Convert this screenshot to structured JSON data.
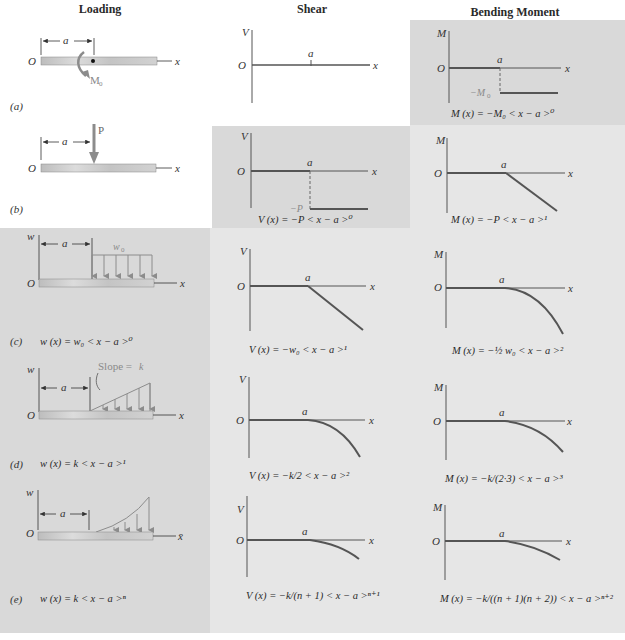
{
  "headers": {
    "loading": "Loading",
    "shear": "Shear",
    "moment": "Bending Moment"
  },
  "colors": {
    "panel_dark": "#d9d9d9",
    "panel_light": "#e6e6e6",
    "curve": "#6a6a6a",
    "beam": "#c8c8c8",
    "load_arrow": "#8c8c8c"
  },
  "axis_labels": {
    "origin": "O",
    "x": "x",
    "x_bar": "x̄",
    "a": "a",
    "w": "w",
    "V": "V",
    "M": "M"
  },
  "rows": [
    {
      "tag": "(a)",
      "loading": {
        "type": "couple",
        "load_label": "M₀",
        "equation": ""
      },
      "shear": {
        "curve": "zero",
        "label_neg": "",
        "equation": ""
      },
      "moment": {
        "curve": "step",
        "label_neg": "−M₀",
        "equation": "M (x) = −M₀ < x − a >⁰"
      }
    },
    {
      "tag": "(b)",
      "loading": {
        "type": "point",
        "load_label": "P",
        "equation": ""
      },
      "shear": {
        "curve": "step",
        "label_neg": "−P",
        "equation": "V (x) = −P < x − a >⁰"
      },
      "moment": {
        "curve": "ramp",
        "label_neg": "",
        "equation": "M (x) = −P < x − a >¹"
      }
    },
    {
      "tag": "(c)",
      "loading": {
        "type": "uniform",
        "load_label": "w₀",
        "equation": "w (x) = w₀ < x − a >⁰"
      },
      "shear": {
        "curve": "ramp",
        "equation": "V (x) = −w₀ < x − a >¹"
      },
      "moment": {
        "curve": "parabola",
        "equation": "M (x) = −½ w₀ < x − a >²"
      }
    },
    {
      "tag": "(d)",
      "loading": {
        "type": "linear",
        "load_label": "Slope = k",
        "equation": "w (x) = k < x − a >¹"
      },
      "shear": {
        "curve": "parabola",
        "equation": "V (x) = −k/2 < x − a >²"
      },
      "moment": {
        "curve": "cubic",
        "equation": "M (x) = −k/(2·3) < x − a >³"
      }
    },
    {
      "tag": "(e)",
      "loading": {
        "type": "power",
        "load_label": "",
        "equation": "w (x) = k < x − a >ⁿ"
      },
      "shear": {
        "curve": "power",
        "equation": "V (x) = −k/(n + 1) < x − a >ⁿ⁺¹"
      },
      "moment": {
        "curve": "power",
        "equation": "M (x) = −k/((n + 1)(n + 2)) < x − a >ⁿ⁺²"
      }
    }
  ]
}
